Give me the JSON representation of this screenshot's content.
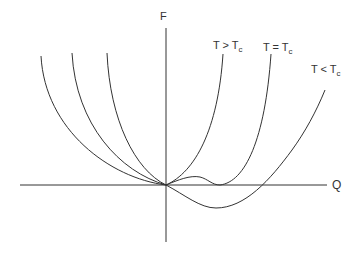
{
  "diagram": {
    "axes": {
      "x_label": "Q",
      "y_label": "F"
    },
    "curves": [
      {
        "id": "above",
        "label_main": "T > T",
        "label_sub": "c"
      },
      {
        "id": "critical",
        "label_main": "T = T",
        "label_sub": "c"
      },
      {
        "id": "below",
        "label_main": "T < T",
        "label_sub": "c"
      }
    ],
    "colors": {
      "line": "#333333",
      "background": "#ffffff"
    }
  }
}
